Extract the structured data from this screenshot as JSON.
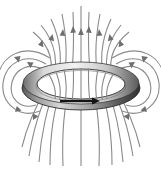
{
  "figure": {
    "background_color": "#ffffff",
    "line_color": "#808080",
    "arrow_color": "#6e6e6e",
    "ring_outline_color": "#2b2b2b",
    "ring_shade_dark": "#3a3a3a",
    "ring_shade_mid": "#8c8c8c",
    "ring_shade_light": "#e8e8e8",
    "current_arrow_color": "#1a1a1a",
    "caption": "",
    "labels": []
  },
  "diagram_data": {
    "type": "physics-field-diagram",
    "width": 161,
    "height": 172,
    "ring": {
      "name": "current-loop",
      "center_x": 81,
      "center_y": 85,
      "outer_rx": 59,
      "outer_ry": 22,
      "inner_rx": 44,
      "inner_ry": 15,
      "thickness": 7,
      "current_direction": "clockwise-viewed-from-above"
    },
    "axis_line": {
      "name": "central-axis-field-line",
      "x": 81,
      "y_top": 6,
      "y_bottom": 166,
      "arrow_y": 31,
      "arrow_direction": "up"
    },
    "inner_lines_count": 11,
    "outer_loops_per_side": 3,
    "arrow_count": 14
  }
}
